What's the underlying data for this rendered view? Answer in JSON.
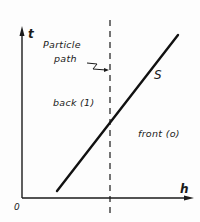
{
  "diagram": {
    "type": "space-time diagram",
    "axes": {
      "vertical": {
        "label": "t"
      },
      "horizontal": {
        "label": "h"
      },
      "origin": {
        "label": "0"
      }
    },
    "lines": {
      "shock": {
        "label": "S",
        "style": "solid"
      },
      "particle_path": {
        "label_line1": "Particle",
        "label_line2": "path",
        "style": "dashed"
      }
    },
    "regions": {
      "back": {
        "label": "back (1)"
      },
      "front": {
        "label": "front (o)"
      }
    },
    "colors": {
      "ink": "#1a1a1a",
      "background": "#fdfdfd"
    }
  }
}
